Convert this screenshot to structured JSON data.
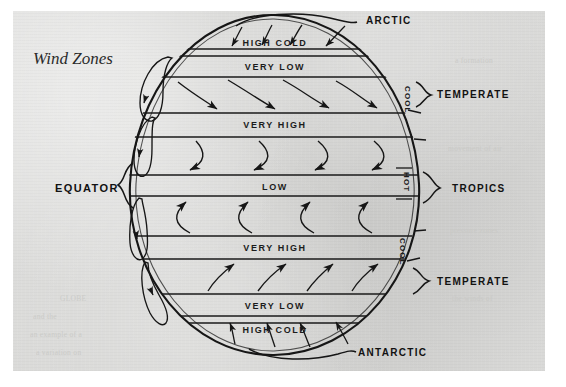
{
  "page": {
    "title": "Wind Zones",
    "paper_color": "#d6d6d4",
    "ink_color": "#1a1a1a",
    "border_color": "#ffffff"
  },
  "diagram": {
    "type": "globe-cross-section",
    "globe": {
      "center_x": 274,
      "center_y": 185,
      "radius_x": 146,
      "radius_y": 171
    },
    "bands": [
      {
        "id": "band-n-polar",
        "label": "HIGH COLD",
        "y": 40,
        "hemisphere": "north",
        "pressure": "high",
        "temperature": "cold"
      },
      {
        "id": "band-n-subpolar",
        "label": "VERY LOW",
        "y": 63,
        "hemisphere": "north",
        "pressure": "very low"
      },
      {
        "id": "band-n-horse",
        "label": "VERY HIGH",
        "y": 124,
        "hemisphere": "north",
        "pressure": "very high"
      },
      {
        "id": "band-equatorial",
        "label": "LOW",
        "y": 185,
        "hemisphere": "equator",
        "pressure": "low"
      },
      {
        "id": "band-s-horse",
        "label": "VERY HIGH",
        "y": 247,
        "hemisphere": "south",
        "pressure": "very high"
      },
      {
        "id": "band-s-subpolar",
        "label": "VERY LOW",
        "y": 305,
        "hemisphere": "south",
        "pressure": "very low"
      },
      {
        "id": "band-s-polar",
        "label": "HIGH COLD",
        "y": 329,
        "hemisphere": "south",
        "pressure": "high",
        "temperature": "cold"
      }
    ],
    "zone_labels_right": [
      {
        "id": "zone-arctic",
        "text": "ARCTIC",
        "x": 366,
        "y": 20,
        "anchor": "start"
      },
      {
        "id": "zone-temperate-n",
        "text": "TEMPERATE",
        "x": 437,
        "y": 95,
        "anchor": "start"
      },
      {
        "id": "zone-tropics",
        "text": "TROPICS",
        "x": 452,
        "y": 188,
        "anchor": "start"
      },
      {
        "id": "zone-temperate-s",
        "text": "TEMPERATE",
        "x": 437,
        "y": 281,
        "anchor": "start"
      },
      {
        "id": "zone-antarctic",
        "text": "ANTARCTIC",
        "x": 358,
        "y": 352,
        "anchor": "start"
      }
    ],
    "zone_labels_left": [
      {
        "id": "zone-equator",
        "text": "EQUATOR",
        "x": 55,
        "y": 189,
        "anchor": "start"
      }
    ],
    "edge_labels": [
      {
        "id": "edge-cool-north",
        "text": "COOL",
        "x": 405,
        "y": 92,
        "rotation": 90
      },
      {
        "id": "edge-hot",
        "text": "HOT",
        "x": 404,
        "y": 176,
        "rotation": 90
      },
      {
        "id": "edge-cool-south",
        "text": "COOL",
        "x": 400,
        "y": 243,
        "rotation": 90
      }
    ],
    "band_line_ys": [
      48,
      55,
      78,
      86,
      113,
      137,
      175,
      196,
      232,
      259,
      293,
      315,
      337,
      342
    ]
  },
  "ghost_text": [
    {
      "text": "a formation",
      "x": 455,
      "y": 62
    },
    {
      "text": "movement of air",
      "x": 448,
      "y": 150
    },
    {
      "text": "pressure zones",
      "x": 450,
      "y": 232
    },
    {
      "text": "the winds of",
      "x": 452,
      "y": 300
    },
    {
      "text": "GLOBE",
      "x": 60,
      "y": 300
    },
    {
      "text": "and the",
      "x": 33,
      "y": 318
    },
    {
      "text": "an example of a",
      "x": 30,
      "y": 336
    },
    {
      "text": "a variation on",
      "x": 36,
      "y": 354
    }
  ]
}
